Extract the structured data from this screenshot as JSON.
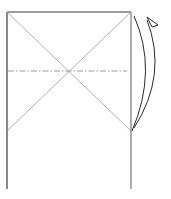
{
  "diagram": {
    "type": "origami-fold-step",
    "colors": {
      "outline": "#3a3a3a",
      "crease": "#a8a8a8",
      "fold_line": "#9a9a9a",
      "arrow": "#2a2a2a"
    },
    "paper": {
      "left": 7,
      "right": 131,
      "top": 12,
      "bottom": 189
    },
    "crease_x_bottom": 131,
    "fold_line_y": 71,
    "arrow": {
      "start": [
        132,
        131
      ],
      "end": [
        147,
        17
      ]
    }
  }
}
